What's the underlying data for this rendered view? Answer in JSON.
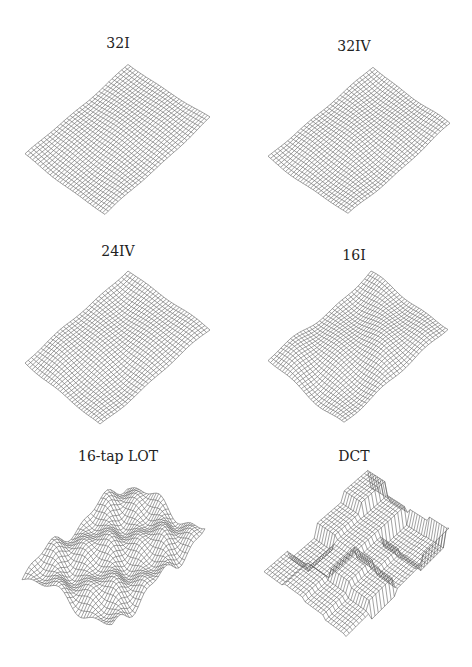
{
  "figure": {
    "panels": [
      {
        "id": "p32I",
        "title": "32I"
      },
      {
        "id": "p32IV",
        "title": "32IV"
      },
      {
        "id": "p24IV",
        "title": "24IV"
      },
      {
        "id": "p16I",
        "title": "16I"
      },
      {
        "id": "pLOT",
        "title": "16-tap LOT"
      },
      {
        "id": "pDCT",
        "title": "DCT"
      }
    ]
  },
  "chart_data": [
    {
      "type": "surface",
      "title": "32I",
      "description": "3D wireframe mesh of reconstructed smooth surface; nearly flat with slight gentle undulations",
      "grid": "~32x32 mesh",
      "roughness": "very low"
    },
    {
      "type": "surface",
      "title": "32IV",
      "description": "3D wireframe mesh; nearly flat with slight ripples",
      "grid": "~32x32 mesh",
      "roughness": "low"
    },
    {
      "type": "surface",
      "title": "24IV",
      "description": "3D wireframe mesh; mostly flat with faint ridge artifacts",
      "grid": "~32x32 mesh",
      "roughness": "low"
    },
    {
      "type": "surface",
      "title": "16I",
      "description": "3D wireframe mesh; moderate bumps/ripples",
      "grid": "~32x32 mesh",
      "roughness": "moderate"
    },
    {
      "type": "surface",
      "title": "16-tap LOT",
      "description": "3D wireframe mesh; pronounced undulations with block-like folds",
      "grid": "~32x32 mesh",
      "roughness": "high"
    },
    {
      "type": "surface",
      "title": "DCT",
      "description": "3D wireframe mesh; strong blocking artifacts with stepped plateaus",
      "grid": "~32x32 mesh",
      "roughness": "very high (blocky)"
    }
  ]
}
